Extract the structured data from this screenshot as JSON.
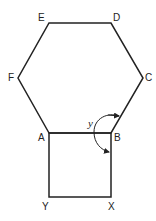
{
  "diagram": {
    "type": "geometry",
    "labels": {
      "A": "A",
      "B": "B",
      "C": "C",
      "D": "D",
      "E": "E",
      "F": "F",
      "X": "X",
      "Y": "Y",
      "angle": "y"
    },
    "line_color": "#222222"
  }
}
